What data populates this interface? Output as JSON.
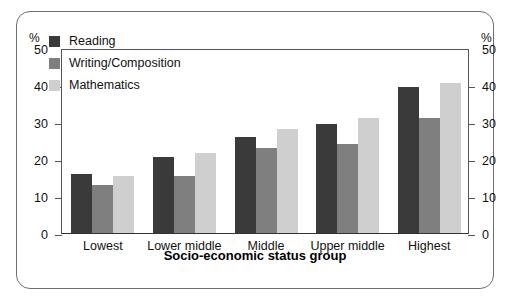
{
  "figure": {
    "y_axis_unit_left": "%",
    "y_axis_unit_right": "%",
    "x_axis_title": "Socio-economic status group"
  },
  "chart_data": {
    "type": "bar",
    "title": "",
    "subtitle": "",
    "xlabel": "Socio-economic status group",
    "ylabel": "%",
    "ylabel_right": "%",
    "ylim": [
      0,
      50
    ],
    "yticks": [
      0,
      10,
      20,
      30,
      40,
      50
    ],
    "ytick_labels": [
      "0",
      "10",
      "20",
      "30",
      "40",
      "50"
    ],
    "grid": false,
    "legend_position": "upper left inside plot",
    "categories": [
      "Lowest",
      "Lower middle",
      "Middle",
      "Upper middle",
      "Highest"
    ],
    "series": [
      {
        "name": "Reading",
        "color": "#3a3a3a",
        "values": [
          16,
          20.5,
          26,
          29.5,
          39.5
        ]
      },
      {
        "name": "Writing/Composition",
        "color": "#7f7f7f",
        "values": [
          13,
          15.5,
          23,
          24,
          31
        ]
      },
      {
        "name": "Mathematics",
        "color": "#cfcfcf",
        "values": [
          15.5,
          21.5,
          28,
          31,
          40.5
        ]
      }
    ]
  }
}
